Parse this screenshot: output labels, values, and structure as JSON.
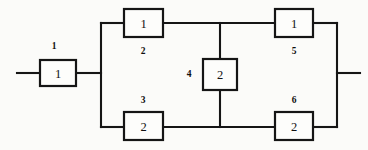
{
  "diagram": {
    "kind": "reliability-block-diagram",
    "title": "",
    "background_color": "#fbfbf9",
    "line_color": "#151515",
    "block_fill": "#fdfdfb",
    "blocks": [
      {
        "index_label": "1",
        "value": "1",
        "position": "input-series",
        "index_placement": "above",
        "x": 40,
        "y": 60,
        "w": 36,
        "h": 26,
        "index_x": 54,
        "index_y": 46
      },
      {
        "index_label": "2",
        "value": "1",
        "position": "upper-left-branch",
        "index_placement": "below",
        "x": 124,
        "y": 9,
        "w": 39,
        "h": 28,
        "index_x": 143,
        "index_y": 51
      },
      {
        "index_label": "3",
        "value": "2",
        "position": "lower-left-branch",
        "index_placement": "above",
        "x": 124,
        "y": 112,
        "w": 39,
        "h": 28,
        "index_x": 143,
        "index_y": 100
      },
      {
        "index_label": "4",
        "value": "2",
        "position": "bridge-center",
        "index_placement": "left",
        "x": 203,
        "y": 59,
        "w": 34,
        "h": 31,
        "index_x": 189,
        "index_y": 74
      },
      {
        "index_label": "5",
        "value": "1",
        "position": "upper-right-branch",
        "index_placement": "below",
        "x": 275,
        "y": 9,
        "w": 38,
        "h": 28,
        "index_x": 294,
        "index_y": 51
      },
      {
        "index_label": "6",
        "value": "2",
        "position": "lower-right-branch",
        "index_placement": "above",
        "x": 275,
        "y": 112,
        "w": 38,
        "h": 28,
        "index_x": 294,
        "index_y": 100
      }
    ],
    "wires": [
      {
        "name": "input-lead",
        "d": "M 17 73 L 40 73"
      },
      {
        "name": "block1-to-left-bus",
        "d": "M 76 73 L 101 73"
      },
      {
        "name": "left-bus-vertical",
        "d": "M 101 23 L 101 127"
      },
      {
        "name": "left-bus-to-block2",
        "d": "M 101 23 L 124 23"
      },
      {
        "name": "left-bus-to-block3",
        "d": "M 101 127 L 124 127"
      },
      {
        "name": "block2-to-top-node",
        "d": "M 163 23 L 220 23"
      },
      {
        "name": "top-node-to-block5",
        "d": "M 220 23 L 275 23"
      },
      {
        "name": "block3-to-bottom-node",
        "d": "M 163 127 L 220 127"
      },
      {
        "name": "bottom-node-to-block6",
        "d": "M 220 127 L 275 127"
      },
      {
        "name": "bridge-upper-stub",
        "d": "M 220 23 L 220 59"
      },
      {
        "name": "bridge-lower-stub",
        "d": "M 220 90 L 220 127"
      },
      {
        "name": "block5-to-right-bus",
        "d": "M 313 23 L 337 23"
      },
      {
        "name": "block6-to-right-bus",
        "d": "M 313 127 L 337 127"
      },
      {
        "name": "right-bus-vertical",
        "d": "M 337 23 L 337 127"
      },
      {
        "name": "output-lead",
        "d": "M 337 73 L 360 73"
      }
    ]
  }
}
